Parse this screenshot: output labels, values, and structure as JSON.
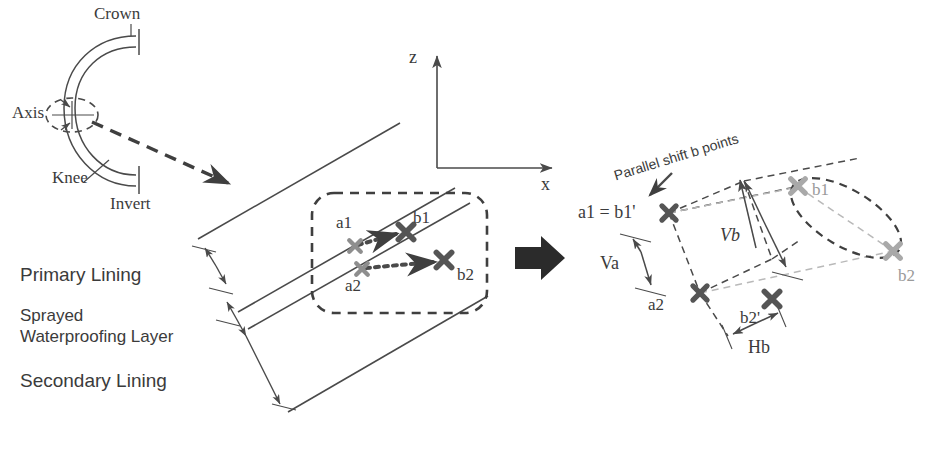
{
  "figure": {
    "colors": {
      "line": "#4a4a4a",
      "dark_marker": "#555555",
      "light_marker": "#8e8e8e",
      "gray_marker": "#a9a9a9",
      "text": "#3b3b3b",
      "gray_text": "#9a9a9a",
      "background": "#ffffff"
    }
  },
  "cross_section": {
    "labels": {
      "crown": "Crown",
      "axis": "Axis",
      "knee": "Knee",
      "invert": "Invert"
    }
  },
  "axes": {
    "z_label": "z",
    "x_label": "x"
  },
  "lining": {
    "labels": {
      "primary": "Primary Lining",
      "sprayed_line1": "Sprayed",
      "sprayed_line2": "Waterproofing Layer",
      "secondary": "Secondary Lining"
    }
  },
  "left_panel": {
    "points": [
      {
        "id": "a1",
        "label": "a1",
        "kind": "start",
        "shade": "light"
      },
      {
        "id": "b1",
        "label": "b1",
        "kind": "end",
        "shade": "dark"
      },
      {
        "id": "a2",
        "label": "a2",
        "kind": "start",
        "shade": "light"
      },
      {
        "id": "b2",
        "label": "b2",
        "kind": "end",
        "shade": "dark"
      }
    ],
    "vectors": [
      {
        "from": "a1",
        "to": "b1"
      },
      {
        "from": "a2",
        "to": "b2"
      }
    ]
  },
  "transition": {
    "arrow": "block-arrow-right"
  },
  "right_panel": {
    "annotation": "Parallel shift b points",
    "points": [
      {
        "id": "a1b1p",
        "label": "a1 = b1'",
        "shade": "dark"
      },
      {
        "id": "a2",
        "label": "a2",
        "shade": "dark"
      },
      {
        "id": "b2p",
        "label": "b2'",
        "shade": "dark"
      },
      {
        "id": "b1",
        "label": "b1",
        "shade": "gray"
      },
      {
        "id": "b2",
        "label": "b2",
        "shade": "gray"
      }
    ],
    "dimensions": [
      {
        "id": "Va",
        "label": "Va",
        "orientation": "vertical"
      },
      {
        "id": "Vb",
        "label": "Vb",
        "orientation": "vertical"
      },
      {
        "id": "Hb",
        "label": "Hb",
        "orientation": "horizontal"
      }
    ]
  }
}
